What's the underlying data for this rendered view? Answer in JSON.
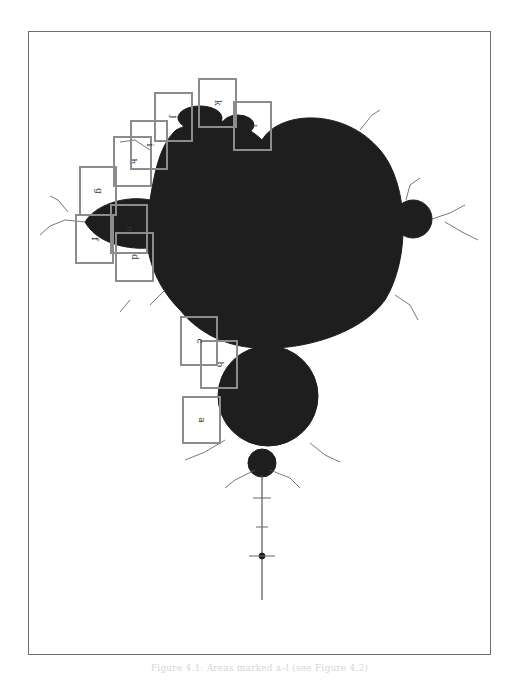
{
  "figure": {
    "fill_color": "#1e1e1e",
    "box_color": "#8c8c8c",
    "boxes": [
      {
        "label": "a",
        "x": 183,
        "y": 397,
        "w": 37,
        "h": 46
      },
      {
        "label": "b",
        "x": 201,
        "y": 341,
        "w": 36,
        "h": 47
      },
      {
        "label": "c",
        "x": 181,
        "y": 317,
        "w": 36,
        "h": 48
      },
      {
        "label": "d",
        "x": 116,
        "y": 233,
        "w": 37,
        "h": 48
      },
      {
        "label": "e",
        "x": 111,
        "y": 205,
        "w": 36,
        "h": 48
      },
      {
        "label": "f",
        "x": 76,
        "y": 215,
        "w": 37,
        "h": 48
      },
      {
        "label": "g",
        "x": 80,
        "y": 167,
        "w": 36,
        "h": 48
      },
      {
        "label": "h",
        "x": 114,
        "y": 137,
        "w": 37,
        "h": 49
      },
      {
        "label": "i",
        "x": 131,
        "y": 121,
        "w": 36,
        "h": 48
      },
      {
        "label": "j",
        "x": 155,
        "y": 93,
        "w": 37,
        "h": 48
      },
      {
        "label": "k",
        "x": 199,
        "y": 79,
        "w": 37,
        "h": 48
      },
      {
        "label": "l",
        "x": 234,
        "y": 102,
        "w": 37,
        "h": 48
      }
    ]
  },
  "caption": "Figure 4.1: Areas marked a–l (see Figure 4.2)"
}
